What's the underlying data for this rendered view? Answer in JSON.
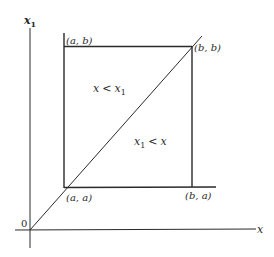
{
  "diagram": {
    "type": "region-diagram",
    "axes": {
      "x_label": "x",
      "y_label_base": "x",
      "y_label_sub": "1",
      "origin_label": "0"
    },
    "square": {
      "corners": {
        "top_left": "(a, b)",
        "top_right": "(b, b)",
        "bottom_left": "(a, a)",
        "bottom_right": "(b, a)"
      }
    },
    "regions": {
      "upper_left": {
        "left": "x",
        "op": "<",
        "right_base": "x",
        "right_sub": "1"
      },
      "lower_right": {
        "left_base": "x",
        "left_sub": "1",
        "op": "<",
        "right": "x"
      }
    },
    "colors": {
      "line": "#2a2a2a",
      "background": "#ffffff"
    }
  }
}
